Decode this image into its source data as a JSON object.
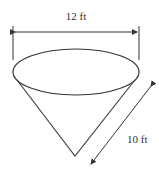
{
  "diagram": {
    "shape": "inverted cone",
    "diameter_label": "12 ft",
    "slant_height_label": "10 ft",
    "colors": {
      "stroke": "#333333",
      "background": "#ffffff"
    }
  }
}
